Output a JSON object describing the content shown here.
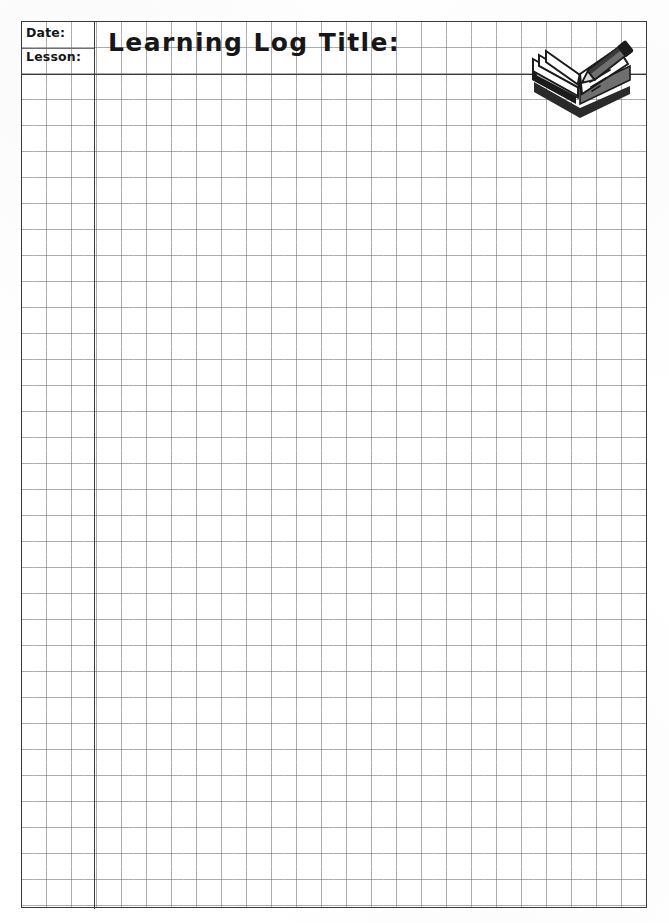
{
  "document": {
    "type": "learning-log-worksheet",
    "page_width": 669,
    "page_height": 923,
    "background_color": "#ffffff"
  },
  "table": {
    "border_color": "#3a3a3a",
    "grid_line_color": "#787a80",
    "grid_cell_width": 25,
    "grid_cell_height": 26,
    "columns": 25,
    "rows": 34
  },
  "header": {
    "stub": {
      "date_label": "Date:",
      "lesson_label": "Lesson:"
    },
    "title_label": "Learning Log Title:",
    "illustration": {
      "name": "open-book-with-pencil-icon",
      "description": "Open book being written on with a pencil",
      "ink_color": "#1b1b1b",
      "shade_color": "#8d8d8d"
    }
  },
  "body": {
    "content": "",
    "placeholder": "Blank grid for student notes"
  }
}
